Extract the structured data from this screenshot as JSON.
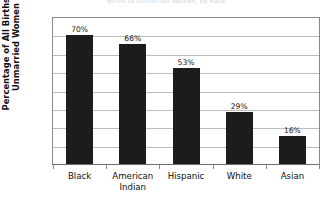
{
  "chart_data": {
    "type": "bar",
    "title": "Births to Unmarried Women, by Race",
    "xlabel": "",
    "ylabel": "Percentage of All Births by Unmarried Women",
    "ylabel_lines": [
      "Percentage of All Births by",
      "Unmarried Women"
    ],
    "categories": [
      "Black",
      "American Indian",
      "Hispanic",
      "White",
      "Asian"
    ],
    "category_lines": [
      [
        "Black"
      ],
      [
        "American",
        "Indian"
      ],
      [
        "Hispanic"
      ],
      [
        "White"
      ],
      [
        "Asian"
      ]
    ],
    "values": [
      70,
      66,
      53,
      29,
      16
    ],
    "plotted_values": [
      70,
      65.5,
      52.5,
      28.5,
      15.5
    ],
    "data_labels": [
      "70%",
      "66%",
      "53%",
      "29%",
      "16%"
    ],
    "ylim": [
      0,
      80
    ],
    "y_ticks": [
      0,
      10,
      20,
      30,
      40,
      50,
      60,
      70,
      80
    ],
    "y_tick_labels": [
      "0",
      "10",
      "20",
      "30",
      "40",
      "50",
      "60",
      "70",
      "80"
    ],
    "grid": true,
    "grid_axis": "y",
    "legend": false,
    "legend_position": "none",
    "bar_color": "#1c1c1c",
    "grid_color": "#bcbcbc",
    "axis_color": "#8a8a8a",
    "background_color": "#ffffff"
  }
}
